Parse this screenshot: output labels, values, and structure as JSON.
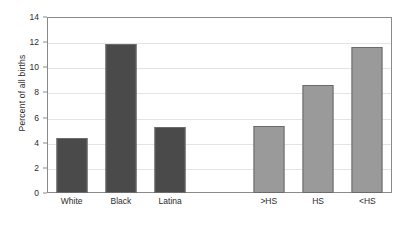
{
  "chart_data": {
    "type": "bar",
    "title": "",
    "xlabel": "",
    "ylabel": "Percent of all births",
    "ylim": [
      0,
      14
    ],
    "yticks": [
      0,
      2,
      4,
      6,
      8,
      10,
      12,
      14
    ],
    "ytick_labels": [
      "0",
      "2",
      "4",
      "6",
      "8",
      "10",
      "12",
      "14"
    ],
    "grid": true,
    "legend": "none",
    "categories": [
      "White",
      "Black",
      "Latina",
      "",
      ">HS",
      "HS",
      "<HS"
    ],
    "values": [
      4.4,
      11.85,
      5.25,
      null,
      5.3,
      8.6,
      11.6
    ],
    "groups": [
      {
        "name": "race-ethnicity",
        "categories": [
          "White",
          "Black",
          "Latina"
        ],
        "values": [
          4.4,
          11.85,
          5.25
        ],
        "color": "#4a4a4a"
      },
      {
        "name": "education",
        "categories": [
          ">HS",
          "HS",
          "<HS"
        ],
        "values": [
          5.3,
          8.6,
          11.6
        ],
        "color": "#9a9a9a"
      }
    ],
    "bar_colors": [
      "#4a4a4a",
      "#4a4a4a",
      "#4a4a4a",
      null,
      "#9a9a9a",
      "#9a9a9a",
      "#9a9a9a"
    ]
  },
  "colors": {
    "dark_bar": "#4a4a4a",
    "light_bar": "#9a9a9a",
    "bar_border": "#6b6b6b",
    "frame": "#8a8a8a",
    "gridline": "#e4e4e4",
    "text": "#2b2b2b",
    "background": "#ffffff"
  }
}
